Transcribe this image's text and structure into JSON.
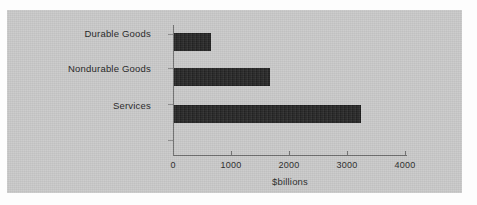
{
  "chart_data": {
    "type": "bar",
    "orientation": "horizontal",
    "title": "",
    "categories": [
      "Durable Goods",
      "Nondurable Goods",
      "Services"
    ],
    "values": [
      640,
      1640,
      3190
    ],
    "series": [
      {
        "name": "Consumption Expenditures",
        "values": [
          640,
          1640,
          3190
        ]
      }
    ],
    "xlabel": "$billions",
    "ylabel": "",
    "xlim": [
      0,
      4000
    ],
    "xticks": [
      "0",
      "1000",
      "2000",
      "3000",
      "4000"
    ],
    "xtick_values": [
      0,
      1000,
      2000,
      3000,
      4000
    ],
    "grid": false,
    "legend": "none",
    "colors": {
      "panel_background": "#c9c9c9",
      "bar_fill": "#262626",
      "axis_line": "#6e6e6e",
      "text": "#1f1f1f",
      "page_background": "#fdfdfd"
    }
  }
}
